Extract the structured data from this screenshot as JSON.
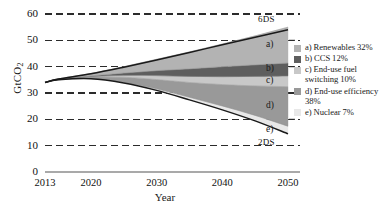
{
  "chart_data": {
    "type": "area",
    "title": "",
    "xlabel": "Year",
    "ylabel": "GtCO2",
    "ylabel_display": "GtCO",
    "ylabel_sub": "2",
    "xlim": [
      2013,
      2050
    ],
    "ylim": [
      0,
      60
    ],
    "yticks": [
      0,
      10,
      20,
      30,
      40,
      50,
      60
    ],
    "xticks": [
      2013,
      2020,
      2030,
      2040,
      2050
    ],
    "grid": "horizontal-dashed",
    "legend_position": "right",
    "x": [
      2013,
      2015,
      2020,
      2025,
      2030,
      2035,
      2040,
      2045,
      2050
    ],
    "baseline_name": "6DS",
    "target_name": "2DS",
    "baseline_values": [
      34.0,
      35.3,
      37.3,
      39.8,
      42.5,
      45.4,
      48.3,
      51.2,
      54.0
    ],
    "target_values": [
      34.0,
      35.0,
      35.4,
      33.8,
      31.0,
      27.4,
      23.6,
      19.4,
      14.5
    ],
    "series": [
      {
        "name": "a) Renewables",
        "key": "a",
        "share": "32%",
        "color": "#b3b3b3",
        "values": [
          0.0,
          0.15,
          0.9,
          2.4,
          4.3,
          6.4,
          8.6,
          11.0,
          13.6
        ]
      },
      {
        "name": "b) CCS",
        "key": "b",
        "share": "12%",
        "color": "#5e5e5e",
        "values": [
          0.0,
          0.05,
          0.25,
          0.9,
          1.9,
          2.9,
          3.8,
          4.4,
          4.9
        ]
      },
      {
        "name": "c) End-use fuel switching",
        "key": "c",
        "share": "10%",
        "color": "#c8c8c8",
        "values": [
          0.0,
          0.05,
          0.2,
          0.7,
          1.5,
          2.3,
          3.0,
          3.6,
          4.1
        ]
      },
      {
        "name": "d) End-use efficiency",
        "key": "d",
        "share": "38%",
        "color": "#999999",
        "values": [
          0.0,
          0.08,
          0.55,
          1.9,
          3.5,
          5.6,
          8.1,
          11.2,
          15.0
        ]
      },
      {
        "name": "e) Nuclear",
        "key": "e",
        "share": "7%",
        "color": "#e8e8e8",
        "values": [
          0.0,
          0.02,
          0.1,
          0.3,
          0.6,
          1.0,
          1.5,
          2.1,
          2.9
        ]
      }
    ]
  },
  "axis": {
    "y_ticks": [
      "60",
      "50",
      "40",
      "30",
      "20",
      "10",
      "0"
    ],
    "x_ticks": [
      "2013",
      "2020",
      "2030",
      "2040",
      "2050"
    ],
    "x_title": "Year",
    "y_title_main": "GtCO",
    "y_title_sub": "2"
  },
  "annotations": {
    "baseline_label": "6DS",
    "target_label": "2DS",
    "wedge_a": "a)",
    "wedge_b": "b)",
    "wedge_c": "c)",
    "wedge_d": "d)",
    "wedge_e": "e)"
  },
  "legend": {
    "items": [
      {
        "label": "a) Renewables 32%",
        "color": "#b3b3b3"
      },
      {
        "label": "b) CCS 12%",
        "color": "#5e5e5e"
      },
      {
        "label": "c) End-use fuel switching 10%",
        "color": "#c8c8c8"
      },
      {
        "label": "d) End-use efficiency 38%",
        "color": "#999999"
      },
      {
        "label": "e) Nuclear 7%",
        "color": "#e8e8e8"
      }
    ]
  }
}
